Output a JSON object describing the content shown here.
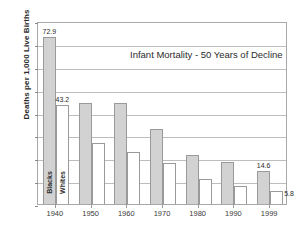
{
  "chart_data": {
    "type": "bar",
    "title": "Infant Mortality - 50 Years of Decline",
    "xlabel": "",
    "ylabel": "Deaths per 1,000 Live Births",
    "categories": [
      "1940",
      "1950",
      "1960",
      "1970",
      "1980",
      "1990",
      "1999"
    ],
    "ylim": [
      0,
      80
    ],
    "ytick_step": 10,
    "yticks": [
      "0",
      "10",
      "20",
      "30",
      "40",
      "50",
      "60",
      "70",
      "80"
    ],
    "grid": true,
    "legend_position": "in-bar-rotated-labels",
    "series": [
      {
        "name": "Blacks",
        "color": "#d2d2d2",
        "values": [
          72.9,
          44.0,
          44.3,
          32.6,
          21.4,
          18.4,
          14.6
        ],
        "labels": [
          "72.9",
          "",
          "",
          "",
          "",
          "",
          "14.6"
        ]
      },
      {
        "name": "Whites",
        "color": "#ffffff",
        "values": [
          43.2,
          26.8,
          22.9,
          17.8,
          11.0,
          7.9,
          5.8
        ],
        "labels": [
          "43.2",
          "",
          "",
          "",
          "",
          "",
          "5.8"
        ]
      }
    ],
    "annotations": [
      {
        "text": "Blacks",
        "target": "1940 gray bar",
        "orientation": "vertical"
      },
      {
        "text": "Whites",
        "target": "1940 white bar",
        "orientation": "vertical"
      }
    ]
  }
}
